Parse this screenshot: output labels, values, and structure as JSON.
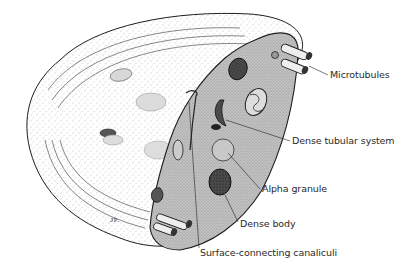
{
  "figure": {
    "labels": {
      "microtubules": "Microtubules",
      "dense_tubular_system": "Dense tubular system",
      "alpha_granule": "Alpha granule",
      "dense_body": "Dense body",
      "surface_connecting_canaliculi": "Surface-connecting canaliculi"
    },
    "colors": {
      "ink": "#1e1e1e",
      "cut_surface": "#b9b9b9",
      "stipple": "#8a8a8a",
      "granule_dark": "#3a3a3a",
      "background": "#ffffff"
    }
  }
}
